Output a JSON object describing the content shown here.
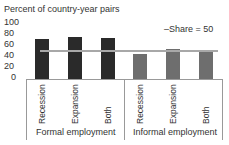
{
  "chart_data": {
    "type": "bar",
    "title": "",
    "ylabel": "Percent of country-year pairs",
    "xlabel": "",
    "ylim": [
      0,
      100
    ],
    "yticks": [
      "100",
      "80",
      "60",
      "40",
      "20",
      "0"
    ],
    "groups": [
      "Formal employment",
      "Informal employment"
    ],
    "categories": [
      "Recession",
      "Expansion",
      "Both",
      "Recession",
      "Expansion",
      "Both"
    ],
    "values": [
      72,
      75,
      73,
      44,
      53,
      51
    ],
    "colors": [
      "#2a2a2a",
      "#2a2a2a",
      "#2a2a2a",
      "#6e6e6e",
      "#6e6e6e",
      "#6e6e6e"
    ],
    "reference_line": {
      "label": "Share = 50",
      "value": 50,
      "color": "#a8a8a8"
    },
    "legend": [
      "Share = 50"
    ],
    "legend_position": "top-right",
    "grid": false
  },
  "legend_label": "–Share = 50"
}
